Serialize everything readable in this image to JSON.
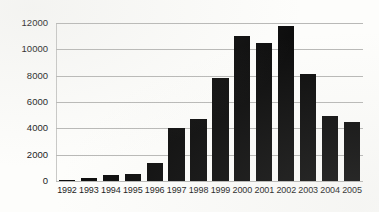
{
  "chart_data": {
    "type": "bar",
    "title": "",
    "subtitle": "",
    "xlabel": "",
    "ylabel": "",
    "categories": [
      "1992",
      "1993",
      "1994",
      "1995",
      "1996",
      "1997",
      "1998",
      "1999",
      "2000",
      "2001",
      "2002",
      "2003",
      "2004",
      "2005"
    ],
    "values": [
      60,
      220,
      420,
      500,
      1350,
      4000,
      4700,
      7800,
      11050,
      10450,
      11750,
      8100,
      4900,
      4450
    ],
    "series": [
      {
        "name": "",
        "values": [
          60,
          220,
          420,
          500,
          1350,
          4000,
          4700,
          7800,
          11050,
          10450,
          11750,
          8100,
          4900,
          4450
        ]
      }
    ],
    "ylim": [
      0,
      12600
    ],
    "yticks": [
      0,
      2000,
      4000,
      6000,
      8000,
      10000,
      12000
    ],
    "ytick_labels": [
      "0",
      "2000",
      "4000",
      "6000",
      "8000",
      "10000",
      "12000"
    ],
    "xtick_labels": [
      "1992",
      "1993",
      "1994",
      "1995",
      "1996",
      "1997",
      "1998",
      "1999",
      "2000",
      "2001",
      "2002",
      "2003",
      "2004",
      "2005"
    ],
    "grid": true,
    "grid_axis": "y",
    "legend": false,
    "legend_position": "none",
    "bar_color": "#0d0d0d",
    "gridline_color": "#b9b9b7",
    "background_color": "#fdfdfb",
    "text_color": "#1b1b1b",
    "annotations": []
  }
}
